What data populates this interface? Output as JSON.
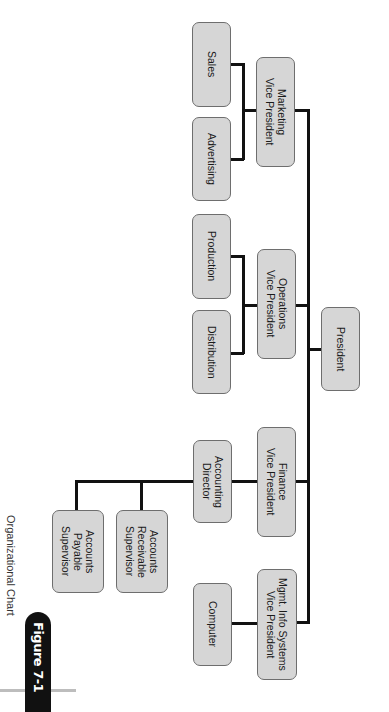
{
  "figure": {
    "tab_label": "Figure 7-1",
    "caption": "Organizational Chart"
  },
  "org_chart": {
    "root": "President",
    "vice_presidents": [
      {
        "title": "Marketing\nVice President",
        "reports": [
          "Sales",
          "Advertising"
        ]
      },
      {
        "title": "Operations\nVice President",
        "reports": [
          "Production",
          "Distribution"
        ]
      },
      {
        "title": "Finance\nVice President",
        "reports": [
          {
            "title": "Accounting\nDirector",
            "reports": [
              "Accounts\nReceivable\nSupervisor",
              "Accounts\nPayable\nSupervisor"
            ]
          }
        ]
      },
      {
        "title": "Mgmt. Info Systems\nVice President",
        "reports": [
          "Computer"
        ]
      }
    ]
  },
  "colors": {
    "box_fill": "#d6d6d6",
    "box_border": "#6e6e6e",
    "line": "#111111",
    "tab": "#111111"
  }
}
